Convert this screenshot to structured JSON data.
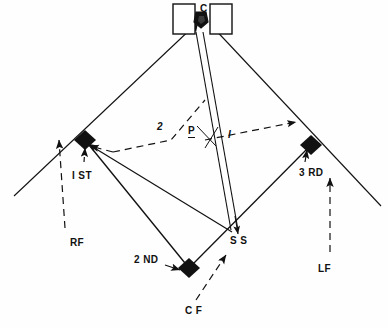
{
  "diagram": {
    "type": "field-diagram",
    "background_color": "#fefefe",
    "ink_color": "#111111"
  },
  "positions": {
    "catcher": {
      "label": "C",
      "role": "catcher",
      "x": 203,
      "y": 12
    },
    "pitcher": {
      "label": "P",
      "role": "pitcher",
      "x": 191,
      "y": 130
    },
    "first_base": {
      "label": "I ST",
      "role": "first-base",
      "x": 75,
      "y": 170
    },
    "second_base": {
      "label": "2 ND",
      "role": "second-base",
      "x": 137,
      "y": 258
    },
    "third_base": {
      "label": "3 RD",
      "role": "third-base",
      "x": 302,
      "y": 170
    },
    "shortstop": {
      "label": "S S",
      "role": "shortstop",
      "x": 233,
      "y": 238
    },
    "right_field": {
      "label": "RF",
      "role": "right-field",
      "x": 73,
      "y": 241
    },
    "center_field": {
      "label": "C F",
      "role": "center-field",
      "x": 190,
      "y": 310
    },
    "left_field": {
      "label": "LF",
      "role": "left-field",
      "x": 322,
      "y": 267
    }
  },
  "annotations": {
    "route_one": {
      "label": "I",
      "x": 230,
      "y": 133
    },
    "route_two": {
      "label": "2",
      "x": 159,
      "y": 126
    }
  },
  "elements": {
    "batters_box_left": "batters-box-left",
    "batters_box_right": "batters-box-right",
    "home_plate": "home-plate",
    "foul_line_right": "foul-line-right",
    "foul_line_left": "foul-line-left"
  }
}
